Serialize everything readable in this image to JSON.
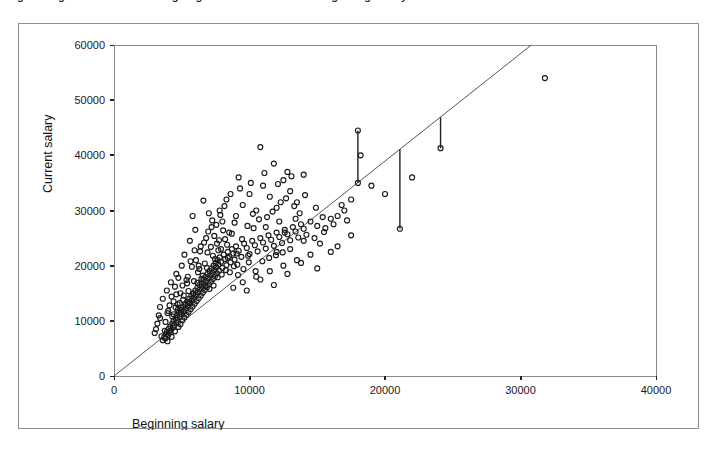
{
  "figure": {
    "clipped_top_text": "igure   Regression Line Showing Regression of Current on Beginning Salary",
    "background_color": "#ffffff",
    "frame_color": "#8d8d8d"
  },
  "chart_data": {
    "type": "scatter",
    "title": "",
    "xlabel": "Beginning salary",
    "ylabel": "Current salary",
    "xlim": [
      0,
      40000
    ],
    "ylim": [
      0,
      60000
    ],
    "xticks": [
      0,
      10000,
      20000,
      30000,
      40000
    ],
    "yticks": [
      0,
      10000,
      20000,
      30000,
      40000,
      50000,
      60000
    ],
    "xtick_labels": [
      "0",
      "10000",
      "20000",
      "30000",
      "40000"
    ],
    "ytick_labels": [
      "0",
      "10000",
      "20000",
      "30000",
      "40000",
      "50000",
      "60000"
    ],
    "grid": false,
    "legend": null,
    "marker": "open-circle",
    "marker_color": "#1a1a1a",
    "marker_size": 5,
    "fit_line": {
      "label": "regression line",
      "type": "line",
      "color": "#555555",
      "intercept": 0,
      "slope": 1.948,
      "x_start": 0,
      "y_start": 0,
      "x_end": 30800,
      "y_end": 60000
    },
    "residual_lines": [
      {
        "x": 18000,
        "y_point": 35000,
        "y_line": 44500
      },
      {
        "x": 21100,
        "y_point": 26700,
        "y_line": 41100
      },
      {
        "x": 24100,
        "y_point": 41300,
        "y_line": 46900
      }
    ],
    "points": [
      [
        3500,
        7200
      ],
      [
        3600,
        6500
      ],
      [
        3700,
        7000
      ],
      [
        3750,
        8200
      ],
      [
        3800,
        6800
      ],
      [
        3850,
        7600
      ],
      [
        3900,
        8000
      ],
      [
        3950,
        6300
      ],
      [
        4000,
        7400
      ],
      [
        4050,
        8600
      ],
      [
        4100,
        7900
      ],
      [
        4150,
        9000
      ],
      [
        4200,
        8300
      ],
      [
        4250,
        7100
      ],
      [
        4300,
        9500
      ],
      [
        4350,
        8800
      ],
      [
        4400,
        10000
      ],
      [
        4450,
        9200
      ],
      [
        4500,
        8100
      ],
      [
        4550,
        10500
      ],
      [
        4600,
        9700
      ],
      [
        4650,
        11000
      ],
      [
        4700,
        10200
      ],
      [
        4750,
        8900
      ],
      [
        4800,
        11500
      ],
      [
        4850,
        10700
      ],
      [
        4900,
        9400
      ],
      [
        4950,
        12000
      ],
      [
        5000,
        11200
      ],
      [
        5050,
        10100
      ],
      [
        5100,
        12500
      ],
      [
        5150,
        11700
      ],
      [
        5200,
        10600
      ],
      [
        5250,
        13000
      ],
      [
        5300,
        12200
      ],
      [
        5350,
        11100
      ],
      [
        5400,
        13500
      ],
      [
        5450,
        12700
      ],
      [
        5500,
        11600
      ],
      [
        5550,
        14000
      ],
      [
        5600,
        13200
      ],
      [
        5650,
        12100
      ],
      [
        5700,
        14500
      ],
      [
        5750,
        13700
      ],
      [
        5800,
        12600
      ],
      [
        5850,
        15000
      ],
      [
        5900,
        14200
      ],
      [
        5950,
        13100
      ],
      [
        6000,
        15500
      ],
      [
        6050,
        14700
      ],
      [
        6100,
        13600
      ],
      [
        6150,
        16000
      ],
      [
        6200,
        15200
      ],
      [
        6250,
        14100
      ],
      [
        6300,
        16500
      ],
      [
        6350,
        15700
      ],
      [
        6400,
        14600
      ],
      [
        6450,
        17000
      ],
      [
        6500,
        16200
      ],
      [
        6550,
        15100
      ],
      [
        6600,
        17500
      ],
      [
        6650,
        16700
      ],
      [
        6700,
        15600
      ],
      [
        6750,
        18000
      ],
      [
        6800,
        17200
      ],
      [
        6850,
        16100
      ],
      [
        6900,
        18500
      ],
      [
        6950,
        17700
      ],
      [
        7000,
        16600
      ],
      [
        7050,
        19000
      ],
      [
        7100,
        18200
      ],
      [
        7150,
        17100
      ],
      [
        7200,
        19500
      ],
      [
        7250,
        18700
      ],
      [
        7300,
        17600
      ],
      [
        7350,
        20000
      ],
      [
        7400,
        19200
      ],
      [
        7450,
        18100
      ],
      [
        7500,
        20500
      ],
      [
        7550,
        19700
      ],
      [
        7600,
        18600
      ],
      [
        7650,
        21000
      ],
      [
        7700,
        20200
      ],
      [
        7750,
        19100
      ],
      [
        7800,
        21500
      ],
      [
        7900,
        20700
      ],
      [
        8000,
        19600
      ],
      [
        8100,
        22000
      ],
      [
        8200,
        21200
      ],
      [
        8300,
        20100
      ],
      [
        8400,
        22500
      ],
      [
        8500,
        21700
      ],
      [
        8600,
        20600
      ],
      [
        8700,
        23000
      ],
      [
        8800,
        22200
      ],
      [
        8900,
        21100
      ],
      [
        9000,
        23500
      ],
      [
        9200,
        22700
      ],
      [
        9400,
        21600
      ],
      [
        9600,
        24000
      ],
      [
        9800,
        23200
      ],
      [
        10000,
        22100
      ],
      [
        10200,
        24500
      ],
      [
        10400,
        23700
      ],
      [
        10600,
        22600
      ],
      [
        10800,
        25000
      ],
      [
        11000,
        24200
      ],
      [
        11200,
        23100
      ],
      [
        11400,
        25500
      ],
      [
        11600,
        24700
      ],
      [
        11800,
        23600
      ],
      [
        12000,
        26000
      ],
      [
        12200,
        25200
      ],
      [
        12400,
        24100
      ],
      [
        12600,
        26500
      ],
      [
        12800,
        25700
      ],
      [
        13000,
        24600
      ],
      [
        13200,
        27000
      ],
      [
        13400,
        26200
      ],
      [
        13600,
        25100
      ],
      [
        13800,
        27500
      ],
      [
        14000,
        26700
      ],
      [
        14200,
        25600
      ],
      [
        14500,
        28000
      ],
      [
        15000,
        27200
      ],
      [
        15500,
        26100
      ],
      [
        16000,
        28500
      ],
      [
        16500,
        29000
      ],
      [
        17000,
        30000
      ],
      [
        17500,
        32000
      ],
      [
        18000,
        35000
      ],
      [
        18000,
        44500
      ],
      [
        18200,
        40000
      ],
      [
        19000,
        34500
      ],
      [
        20000,
        33000
      ],
      [
        21100,
        26700
      ],
      [
        22000,
        36000
      ],
      [
        24100,
        41300
      ],
      [
        31800,
        54000
      ],
      [
        5200,
        22000
      ],
      [
        5600,
        24500
      ],
      [
        6000,
        26500
      ],
      [
        6400,
        23500
      ],
      [
        6800,
        25000
      ],
      [
        7200,
        27000
      ],
      [
        7600,
        24000
      ],
      [
        8000,
        28000
      ],
      [
        8500,
        26000
      ],
      [
        9000,
        29000
      ],
      [
        9500,
        31000
      ],
      [
        10000,
        33000
      ],
      [
        10500,
        30000
      ],
      [
        11000,
        34500
      ],
      [
        11500,
        32500
      ],
      [
        12000,
        30500
      ],
      [
        12500,
        35500
      ],
      [
        13000,
        33500
      ],
      [
        13500,
        31500
      ],
      [
        14000,
        36500
      ],
      [
        10800,
        41500
      ],
      [
        11800,
        38500
      ],
      [
        12800,
        37000
      ],
      [
        9200,
        36000
      ],
      [
        8300,
        32000
      ],
      [
        7800,
        30000
      ],
      [
        7000,
        29500
      ],
      [
        6600,
        31800
      ],
      [
        5800,
        29000
      ],
      [
        5000,
        20000
      ],
      [
        4600,
        18500
      ],
      [
        4200,
        17000
      ],
      [
        3900,
        15500
      ],
      [
        3600,
        14000
      ],
      [
        3400,
        12500
      ],
      [
        3300,
        11000
      ],
      [
        3200,
        9500
      ],
      [
        3100,
        8500
      ],
      [
        3000,
        7800
      ],
      [
        3400,
        10500
      ],
      [
        14500,
        22000
      ],
      [
        15200,
        24000
      ],
      [
        16000,
        22500
      ],
      [
        13500,
        21000
      ],
      [
        12500,
        20000
      ],
      [
        11500,
        19000
      ],
      [
        10500,
        18000
      ],
      [
        9500,
        17000
      ],
      [
        8800,
        16000
      ],
      [
        9800,
        15500
      ],
      [
        10800,
        17500
      ],
      [
        11800,
        16500
      ],
      [
        12800,
        18500
      ],
      [
        13800,
        20500
      ],
      [
        15000,
        19500
      ],
      [
        16500,
        23500
      ],
      [
        17500,
        25500
      ],
      [
        12000,
        22500
      ],
      [
        13000,
        23000
      ],
      [
        14000,
        24500
      ],
      [
        12600,
        26000
      ],
      [
        13400,
        28500
      ],
      [
        15600,
        26800
      ],
      [
        16200,
        27500
      ],
      [
        17200,
        28200
      ],
      [
        14800,
        25000
      ],
      [
        6200,
        18800
      ],
      [
        6700,
        20400
      ],
      [
        7300,
        21800
      ],
      [
        7900,
        23000
      ],
      [
        5400,
        16800
      ],
      [
        4900,
        15000
      ],
      [
        4400,
        13500
      ],
      [
        4700,
        12000
      ],
      [
        5100,
        13800
      ],
      [
        5500,
        15400
      ],
      [
        5900,
        17200
      ],
      [
        6300,
        19400
      ],
      [
        6900,
        22400
      ],
      [
        7400,
        25400
      ],
      [
        8200,
        24800
      ],
      [
        8900,
        27800
      ],
      [
        7700,
        22800
      ],
      [
        8400,
        21400
      ],
      [
        9100,
        20200
      ],
      [
        9900,
        21800
      ],
      [
        10300,
        26800
      ],
      [
        11300,
        28800
      ],
      [
        12300,
        31500
      ],
      [
        13700,
        29500
      ],
      [
        14900,
        30500
      ],
      [
        16800,
        31000
      ],
      [
        4000,
        11800
      ],
      [
        4300,
        10800
      ],
      [
        4600,
        14800
      ],
      [
        4850,
        13200
      ],
      [
        5150,
        14600
      ],
      [
        5450,
        18000
      ],
      [
        5750,
        19800
      ],
      [
        6050,
        21000
      ],
      [
        6350,
        22600
      ],
      [
        6650,
        24200
      ],
      [
        6950,
        26200
      ],
      [
        7250,
        28200
      ],
      [
        7550,
        27400
      ],
      [
        7850,
        29200
      ],
      [
        8150,
        30800
      ],
      [
        8600,
        33000
      ],
      [
        9300,
        34000
      ],
      [
        10100,
        35000
      ],
      [
        11100,
        36800
      ],
      [
        12100,
        34800
      ],
      [
        13100,
        36200
      ],
      [
        4500,
        16200
      ],
      [
        4750,
        17800
      ],
      [
        5050,
        16400
      ],
      [
        5350,
        17400
      ],
      [
        5650,
        20800
      ],
      [
        5950,
        22800
      ],
      [
        6250,
        20000
      ],
      [
        6550,
        18200
      ],
      [
        6850,
        19600
      ],
      [
        7150,
        23400
      ],
      [
        7450,
        21200
      ],
      [
        7750,
        24600
      ],
      [
        8050,
        26400
      ],
      [
        8350,
        23800
      ],
      [
        8700,
        25800
      ],
      [
        9050,
        22200
      ],
      [
        9450,
        24800
      ],
      [
        9850,
        27200
      ],
      [
        10250,
        29400
      ],
      [
        10700,
        28400
      ],
      [
        11200,
        27000
      ],
      [
        11700,
        29800
      ],
      [
        12200,
        28000
      ],
      [
        12700,
        32200
      ],
      [
        13300,
        30800
      ],
      [
        14100,
        32800
      ],
      [
        15400,
        28800
      ],
      [
        3800,
        9800
      ],
      [
        3950,
        11400
      ],
      [
        4100,
        12800
      ],
      [
        4250,
        14400
      ],
      [
        4400,
        11200
      ],
      [
        4550,
        12400
      ],
      [
        4700,
        13000
      ],
      [
        4950,
        11600
      ],
      [
        5250,
        12900
      ],
      [
        5550,
        13400
      ],
      [
        5850,
        14900
      ],
      [
        6150,
        16900
      ],
      [
        6450,
        17600
      ],
      [
        6750,
        16300
      ],
      [
        7050,
        15800
      ],
      [
        7350,
        16400
      ],
      [
        7650,
        17900
      ],
      [
        7950,
        18400
      ],
      [
        8250,
        19200
      ],
      [
        8550,
        18800
      ],
      [
        8850,
        19900
      ],
      [
        9150,
        18300
      ],
      [
        9550,
        19400
      ],
      [
        9950,
        20600
      ],
      [
        10450,
        19000
      ],
      [
        10950,
        20800
      ],
      [
        11450,
        21400
      ],
      [
        11950,
        21900
      ],
      [
        12450,
        22400
      ]
    ]
  }
}
